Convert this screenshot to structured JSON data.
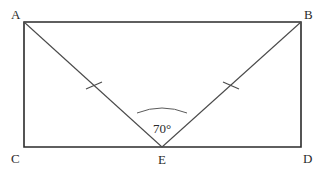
{
  "figure": {
    "background_color": "#ffffff",
    "stroke_color": "#2b2b2b",
    "diagonal_color": "#4a4a4a",
    "arc_color": "#5a5a5a"
  },
  "vertices": {
    "a": {
      "label": "A",
      "x": 24,
      "y": 22,
      "label_x": 11,
      "label_y": 19
    },
    "b": {
      "label": "B",
      "x": 301,
      "y": 22,
      "label_x": 304,
      "label_y": 19
    },
    "c": {
      "label": "C",
      "x": 24,
      "y": 147,
      "label_x": 11,
      "label_y": 163
    },
    "d": {
      "label": "D",
      "x": 301,
      "y": 147,
      "label_x": 303,
      "label_y": 163
    },
    "e": {
      "label": "E",
      "x": 162,
      "y": 147,
      "label_x": 158,
      "label_y": 164
    }
  },
  "rectangle": {
    "x": 24,
    "y": 22,
    "width": 277,
    "height": 125,
    "points": "24,22 301,22 301,147 24,147"
  },
  "segments": [
    {
      "name": "segment-ae",
      "x1": 24,
      "y1": 22,
      "x2": 162,
      "y2": 147
    },
    {
      "name": "segment-be",
      "x1": 301,
      "y1": 22,
      "x2": 162,
      "y2": 147
    }
  ],
  "tick_marks": [
    {
      "name": "tick-ae",
      "cx": 94,
      "cy": 86,
      "x1": 86,
      "y1": 89,
      "x2": 102,
      "y2": 82
    },
    {
      "name": "tick-be",
      "cx": 231,
      "cy": 86,
      "x1": 223,
      "y1": 82,
      "x2": 239,
      "y2": 89
    }
  ],
  "angle": {
    "label": "70°",
    "value": 70,
    "unit": "degrees",
    "vertex": "E",
    "label_x": 162,
    "label_y": 133,
    "arc_path": "M 137,113 Q 162,103 187,113"
  }
}
